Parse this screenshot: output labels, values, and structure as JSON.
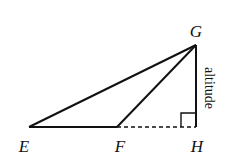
{
  "diagram": {
    "type": "geometry-triangle",
    "points": {
      "E": {
        "label": "E",
        "x": 29,
        "y": 127
      },
      "F": {
        "label": "F",
        "x": 117,
        "y": 127
      },
      "G": {
        "label": "G",
        "x": 196,
        "y": 45
      },
      "H": {
        "label": "H",
        "x": 196,
        "y": 127
      }
    },
    "segments": [
      {
        "from": "E",
        "to": "G",
        "style": "solid"
      },
      {
        "from": "E",
        "to": "F",
        "style": "solid"
      },
      {
        "from": "F",
        "to": "G",
        "style": "solid"
      },
      {
        "from": "G",
        "to": "H",
        "style": "solid"
      },
      {
        "from": "F",
        "to": "H",
        "style": "dashed"
      }
    ],
    "right_angle_at": "H",
    "annotation": {
      "text": "altitude",
      "segment": "GH"
    },
    "colors": {
      "stroke": "#111111",
      "background": "#ffffff"
    }
  }
}
